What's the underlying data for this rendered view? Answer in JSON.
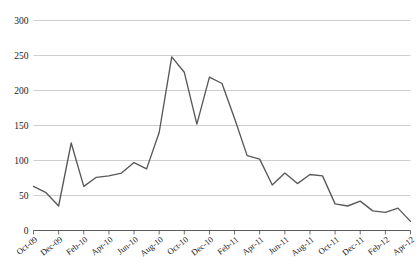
{
  "chart_data": {
    "type": "line",
    "title": "",
    "subtitle": "",
    "xlabel": "",
    "ylabel": "",
    "ylim": [
      0,
      300
    ],
    "ytick_values": [
      0,
      50,
      100,
      150,
      200,
      250,
      300
    ],
    "ytick_labels": [
      "0",
      "50",
      "100",
      "150",
      "200",
      "250",
      "300"
    ],
    "grid": true,
    "legend": false,
    "legend_position": "none",
    "line_color": "#585858",
    "grid_color": "#b9b9b9",
    "axis_color": "#4a4a4a",
    "background_color": "#ffffff",
    "categories": [
      "Oct-09",
      "Nov-09",
      "Dec-09",
      "Jan-10",
      "Feb-10",
      "Mar-10",
      "Apr-10",
      "May-10",
      "Jun-10",
      "Jul-10",
      "Aug-10",
      "Sep-10",
      "Oct-10",
      "Nov-10",
      "Dec-10",
      "Jan-11",
      "Feb-11",
      "Mar-11",
      "Apr-11",
      "May-11",
      "Jun-11",
      "Jul-11",
      "Aug-11",
      "Sep-11",
      "Oct-11",
      "Nov-11",
      "Dec-11",
      "Jan-12",
      "Feb-12",
      "Mar-12",
      "Apr-12"
    ],
    "xtick_labels": [
      "Oct-09",
      "Dec-09",
      "Feb-10",
      "Apr-10",
      "Jun-10",
      "Aug-10",
      "Oct-10",
      "Dec-10",
      "Feb-11",
      "Apr-11",
      "Jun-11",
      "Aug-11",
      "Oct-11",
      "Dec-11",
      "Feb-12",
      "Apr-12"
    ],
    "xtick_indices": [
      0,
      2,
      4,
      6,
      8,
      10,
      12,
      14,
      16,
      18,
      20,
      22,
      24,
      26,
      28,
      30
    ],
    "values": [
      63,
      54,
      35,
      125,
      63,
      76,
      78,
      82,
      97,
      88,
      140,
      248,
      226,
      152,
      219,
      210,
      160,
      107,
      102,
      65,
      82,
      67,
      80,
      78,
      38,
      35,
      42,
      28,
      26,
      32,
      13
    ],
    "series": [
      {
        "name": "series-1",
        "values": [
          63,
          54,
          35,
          125,
          63,
          76,
          78,
          82,
          97,
          88,
          140,
          248,
          226,
          152,
          219,
          210,
          160,
          107,
          102,
          65,
          82,
          67,
          80,
          78,
          38,
          35,
          42,
          28,
          26,
          32,
          13
        ]
      }
    ]
  }
}
